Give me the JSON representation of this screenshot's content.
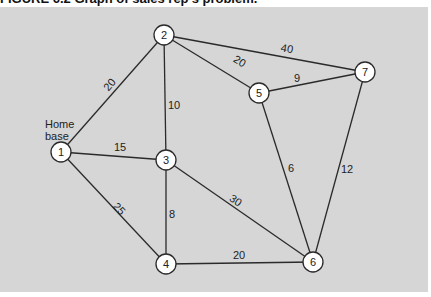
{
  "caption": "FIGURE 6.2  Graph of sales rep's problem.",
  "home_label_1": "Home",
  "home_label_2": "base",
  "colors": {
    "background": "#d6d6d6",
    "node_fill": "#ffffff",
    "line": "#2a2a2a"
  },
  "nodes": [
    {
      "id": "1",
      "x": 61,
      "y": 152
    },
    {
      "id": "2",
      "x": 164,
      "y": 35
    },
    {
      "id": "3",
      "x": 166,
      "y": 160
    },
    {
      "id": "4",
      "x": 166,
      "y": 264
    },
    {
      "id": "5",
      "x": 259,
      "y": 93
    },
    {
      "id": "6",
      "x": 313,
      "y": 262
    },
    {
      "id": "7",
      "x": 365,
      "y": 72
    }
  ],
  "edges": [
    {
      "from": "1",
      "to": "2",
      "weight": "20"
    },
    {
      "from": "1",
      "to": "3",
      "weight": "15"
    },
    {
      "from": "1",
      "to": "4",
      "weight": "25"
    },
    {
      "from": "2",
      "to": "3",
      "weight": "10"
    },
    {
      "from": "2",
      "to": "5",
      "weight": "20"
    },
    {
      "from": "2",
      "to": "7",
      "weight": "40"
    },
    {
      "from": "3",
      "to": "4",
      "weight": "8"
    },
    {
      "from": "3",
      "to": "6",
      "weight": "30"
    },
    {
      "from": "4",
      "to": "6",
      "weight": "20"
    },
    {
      "from": "5",
      "to": "6",
      "weight": "6"
    },
    {
      "from": "5",
      "to": "7",
      "weight": "9"
    },
    {
      "from": "7",
      "to": "6",
      "weight": "12"
    }
  ]
}
